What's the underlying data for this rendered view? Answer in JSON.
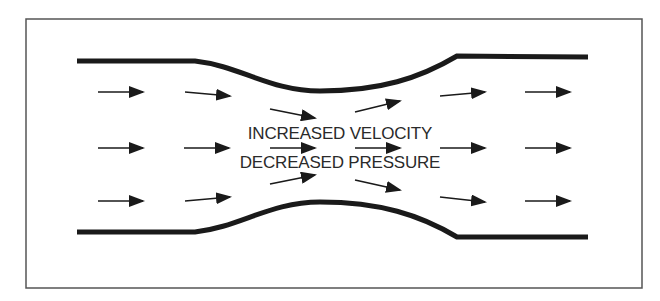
{
  "diagram": {
    "type": "venturi-flow",
    "frame": {
      "x": 26,
      "y": 19,
      "width": 616,
      "height": 269,
      "stroke": "#555555"
    },
    "wall_color": "#1a1a1a",
    "arrow_color": "#1a1a1a",
    "labels": {
      "line1": "INCREASED VELOCITY",
      "line2": "DECREASED PRESSURE"
    },
    "walls": {
      "top": "M77,61 L195,61 C240,66 270,91 320,91 C380,91 420,78 457,56 L588,57",
      "bottom": "M77,232 L195,232 C240,227 270,202 320,202 C380,202 420,215 457,237 L588,237"
    },
    "arrows": {
      "upper": [
        {
          "x1": 98,
          "y1": 92,
          "x2": 143,
          "y2": 92
        },
        {
          "x1": 185,
          "y1": 92,
          "x2": 230,
          "y2": 96
        },
        {
          "x1": 270,
          "y1": 109,
          "x2": 315,
          "y2": 118
        },
        {
          "x1": 355,
          "y1": 112,
          "x2": 400,
          "y2": 101
        },
        {
          "x1": 440,
          "y1": 96,
          "x2": 485,
          "y2": 92
        },
        {
          "x1": 525,
          "y1": 92,
          "x2": 570,
          "y2": 92
        }
      ],
      "middle": [
        {
          "x1": 98,
          "y1": 148,
          "x2": 143,
          "y2": 148
        },
        {
          "x1": 184,
          "y1": 148,
          "x2": 229,
          "y2": 148
        },
        {
          "x1": 270,
          "y1": 148,
          "x2": 315,
          "y2": 148
        },
        {
          "x1": 355,
          "y1": 148,
          "x2": 400,
          "y2": 148
        },
        {
          "x1": 440,
          "y1": 148,
          "x2": 485,
          "y2": 148
        },
        {
          "x1": 525,
          "y1": 148,
          "x2": 570,
          "y2": 148
        }
      ],
      "lower": [
        {
          "x1": 98,
          "y1": 201,
          "x2": 143,
          "y2": 201
        },
        {
          "x1": 185,
          "y1": 201,
          "x2": 230,
          "y2": 197
        },
        {
          "x1": 270,
          "y1": 184,
          "x2": 315,
          "y2": 175
        },
        {
          "x1": 355,
          "y1": 180,
          "x2": 400,
          "y2": 190
        },
        {
          "x1": 440,
          "y1": 197,
          "x2": 485,
          "y2": 202
        },
        {
          "x1": 525,
          "y1": 201,
          "x2": 570,
          "y2": 201
        }
      ]
    }
  }
}
